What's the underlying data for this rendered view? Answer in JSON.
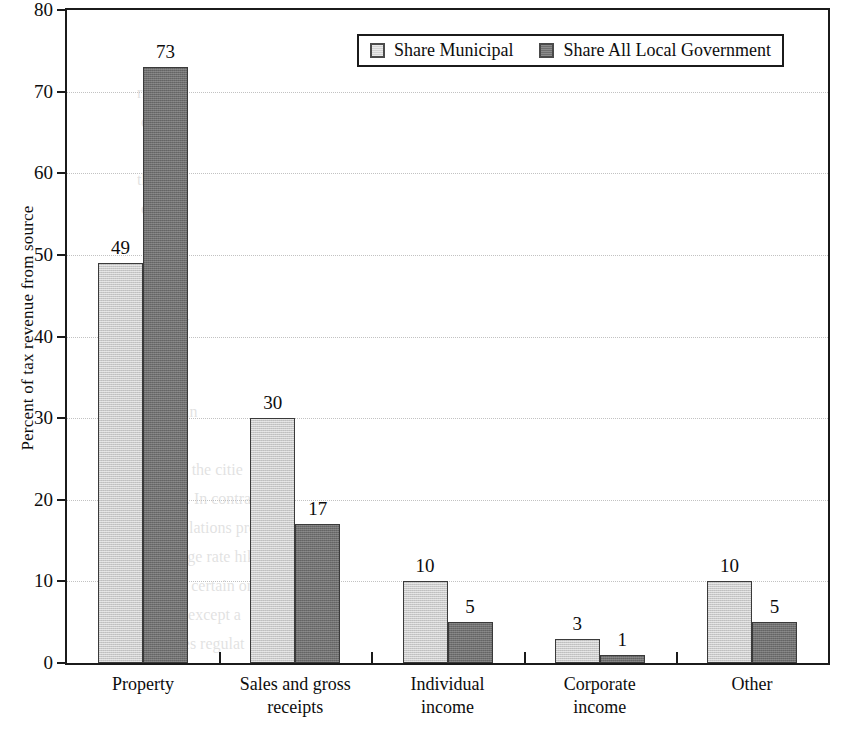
{
  "chart_data": {
    "type": "bar",
    "title": "",
    "subtitle": "",
    "xlabel": "",
    "ylabel": "Percent of tax revenue from source",
    "ylim": [
      0,
      80
    ],
    "ytick_step": 10,
    "grid": true,
    "legend_position": "top-right-inside",
    "categories": [
      "Property",
      "Sales and gross\nreceipts",
      "Individual\nincome",
      "Corporate\nincome",
      "Other"
    ],
    "yticks": [
      "0",
      "10",
      "20",
      "30",
      "40",
      "50",
      "60",
      "70",
      "80"
    ],
    "series": [
      {
        "name": "Share Municipal",
        "color": "#c9c9c9",
        "values": [
          49,
          30,
          10,
          3,
          10
        ],
        "value_labels": [
          "49",
          "30",
          "10",
          "3",
          "10"
        ]
      },
      {
        "name": "Share All Local Government",
        "color": "#6f6f6f",
        "values": [
          73,
          17,
          5,
          1,
          5
        ],
        "value_labels": [
          "73",
          "17",
          "5",
          "1",
          "5"
        ]
      }
    ]
  },
  "legend": {
    "items": [
      {
        "label": "Share Municipal",
        "swatch": "light-gray-swatch"
      },
      {
        "label": "Share All Local Government",
        "swatch": "dark-gray-swatch"
      }
    ]
  },
  "bleed_text": {
    "lines": [
      "right",
      "o pr",
      "ome",
      "the",
      "ouse",
      "esti",
      "con",
      "an",
      "d KEN",
      "nonetar",
      "ld War",
      "tabilizin",
      "o retain",
      "uced in the citie",
      "ngeles. In contras",
      "ent regulations pro",
      "ows large rate hikes",
      "ce rate certain on in",
      "s point, except a",
      "Changes     regulat"
    ]
  }
}
